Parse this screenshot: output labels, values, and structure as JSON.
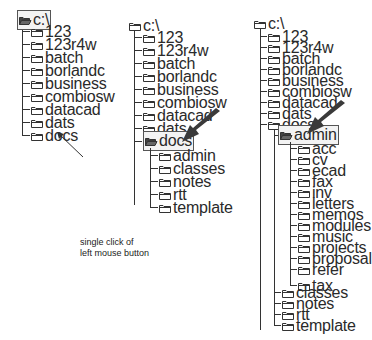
{
  "caption": {
    "line1": "single click of",
    "line2": "left mouse button"
  },
  "panels": [
    {
      "root": "c:\\",
      "root_open": true,
      "root_selected": true,
      "children": [
        "123",
        "123r4w",
        "batch",
        "borlandc",
        "business",
        "combiosw",
        "datacad",
        "dats",
        "docs"
      ]
    },
    {
      "root": "c:\\",
      "children": [
        "123",
        "123r4w",
        "batch",
        "borlandc",
        "business",
        "combiosw",
        "datacad",
        "dats",
        "docs"
      ],
      "selected": "docs",
      "docs_children": [
        "admin",
        "classes",
        "notes",
        "rtt",
        "template"
      ]
    },
    {
      "root": "c:\\",
      "children": [
        "123",
        "123r4w",
        "batch",
        "borlandc",
        "business",
        "combiosw",
        "datacad",
        "dats",
        "docs"
      ],
      "selected": "admin",
      "admin_children": [
        "acc",
        "cv",
        "ecad",
        "fax",
        "inv",
        "letters",
        "memos",
        "modules",
        "music",
        "projects",
        "proposal",
        "refer",
        "tax"
      ],
      "docs_rest": [
        "classes",
        "notes",
        "rtt",
        "template"
      ]
    }
  ],
  "colors": {
    "line": "#333333",
    "arrow": "#333333",
    "background": "#ffffff"
  }
}
